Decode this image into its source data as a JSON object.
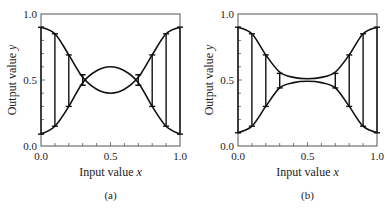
{
  "chart_data": [
    {
      "type": "line",
      "panel_label": "(a)",
      "title": "",
      "xlabel": "Input value x",
      "ylabel": "Output value y",
      "xlim": [
        0.0,
        1.0
      ],
      "ylim": [
        0.0,
        1.0
      ],
      "xticks": [
        "0.0",
        "0.5",
        "1.0"
      ],
      "yticks": [
        "0.0",
        "0.5",
        "1.0"
      ],
      "grid": false,
      "series": [
        {
          "name": "upper-start curve",
          "x": [
            0.0,
            0.1,
            0.2,
            0.3,
            0.4,
            0.5,
            0.6,
            0.7,
            0.8,
            0.9,
            1.0
          ],
          "values": [
            0.9,
            0.85,
            0.69,
            0.52,
            0.43,
            0.4,
            0.43,
            0.52,
            0.69,
            0.85,
            0.9
          ]
        },
        {
          "name": "lower-start curve",
          "x": [
            0.0,
            0.1,
            0.2,
            0.3,
            0.4,
            0.5,
            0.6,
            0.7,
            0.8,
            0.9,
            1.0
          ],
          "values": [
            0.09,
            0.15,
            0.3,
            0.48,
            0.57,
            0.6,
            0.57,
            0.48,
            0.3,
            0.15,
            0.09
          ]
        }
      ],
      "error_bars": [
        {
          "x": 0.0,
          "low": 0.09,
          "high": 0.9
        },
        {
          "x": 0.1,
          "low": 0.15,
          "high": 0.85
        },
        {
          "x": 0.2,
          "low": 0.3,
          "high": 0.69
        },
        {
          "x": 0.3,
          "low": 0.46,
          "high": 0.54
        },
        {
          "x": 0.7,
          "low": 0.46,
          "high": 0.54
        },
        {
          "x": 0.8,
          "low": 0.3,
          "high": 0.69
        },
        {
          "x": 0.9,
          "low": 0.15,
          "high": 0.85
        },
        {
          "x": 1.0,
          "low": 0.09,
          "high": 0.9
        }
      ]
    },
    {
      "type": "line",
      "panel_label": "(b)",
      "title": "",
      "xlabel": "Input value x",
      "ylabel": "Output value y",
      "xlim": [
        0.0,
        1.0
      ],
      "ylim": [
        0.0,
        1.0
      ],
      "xticks": [
        "0.0",
        "0.5",
        "1.0"
      ],
      "yticks": [
        "0.0",
        "0.5",
        "1.0"
      ],
      "grid": false,
      "series": [
        {
          "name": "upper curve",
          "x": [
            0.0,
            0.1,
            0.2,
            0.3,
            0.4,
            0.5,
            0.6,
            0.7,
            0.8,
            0.9,
            1.0
          ],
          "values": [
            0.9,
            0.85,
            0.69,
            0.56,
            0.52,
            0.51,
            0.52,
            0.56,
            0.69,
            0.85,
            0.9
          ]
        },
        {
          "name": "lower curve",
          "x": [
            0.0,
            0.1,
            0.2,
            0.3,
            0.4,
            0.5,
            0.6,
            0.7,
            0.8,
            0.9,
            1.0
          ],
          "values": [
            0.1,
            0.15,
            0.3,
            0.44,
            0.48,
            0.49,
            0.48,
            0.44,
            0.3,
            0.15,
            0.1
          ]
        }
      ],
      "error_bars": [
        {
          "x": 0.0,
          "low": 0.1,
          "high": 0.9
        },
        {
          "x": 0.1,
          "low": 0.15,
          "high": 0.85
        },
        {
          "x": 0.2,
          "low": 0.3,
          "high": 0.69
        },
        {
          "x": 0.3,
          "low": 0.44,
          "high": 0.55
        },
        {
          "x": 0.7,
          "low": 0.44,
          "high": 0.55
        },
        {
          "x": 0.8,
          "low": 0.3,
          "high": 0.69
        },
        {
          "x": 0.9,
          "low": 0.15,
          "high": 0.85
        },
        {
          "x": 1.0,
          "low": 0.1,
          "high": 0.9
        }
      ]
    }
  ],
  "panels": [
    {
      "label": "(a)",
      "xlabel": "Input value ",
      "xvar": "x",
      "ylabel": "Output value ",
      "yvar": "y",
      "ticks_x": [
        "0.0",
        "0.5",
        "1.0"
      ],
      "ticks_y": [
        "0.0",
        "0.5",
        "1.0"
      ]
    },
    {
      "label": "(b)",
      "xlabel": "Input value ",
      "xvar": "x",
      "ylabel": "Output value ",
      "yvar": "y",
      "ticks_x": [
        "0.0",
        "0.5",
        "1.0"
      ],
      "ticks_y": [
        "0.0",
        "0.5",
        "1.0"
      ]
    }
  ]
}
